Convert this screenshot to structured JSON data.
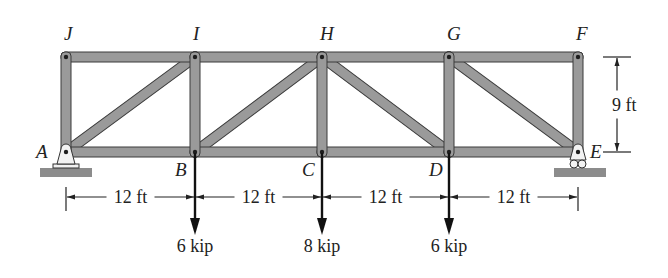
{
  "diagram": {
    "type": "truss",
    "colors": {
      "member": "#9a9a9a",
      "ground": "#8c8c8c",
      "text": "#222222"
    },
    "joints": {
      "J": {
        "label": "J",
        "x": 66,
        "y": 57
      },
      "I": {
        "label": "I",
        "x": 195,
        "y": 57
      },
      "H": {
        "label": "H",
        "x": 322,
        "y": 57
      },
      "G": {
        "label": "G",
        "x": 449,
        "y": 57
      },
      "F": {
        "label": "F",
        "x": 578,
        "y": 57
      },
      "A": {
        "label": "A",
        "x": 66,
        "y": 152
      },
      "B": {
        "label": "B",
        "x": 195,
        "y": 152
      },
      "C": {
        "label": "C",
        "x": 322,
        "y": 152
      },
      "D": {
        "label": "D",
        "x": 449,
        "y": 152
      },
      "E": {
        "label": "E",
        "x": 578,
        "y": 152
      }
    },
    "members": [
      [
        "J",
        "I"
      ],
      [
        "I",
        "H"
      ],
      [
        "H",
        "G"
      ],
      [
        "G",
        "F"
      ],
      [
        "A",
        "B"
      ],
      [
        "B",
        "C"
      ],
      [
        "C",
        "D"
      ],
      [
        "D",
        "E"
      ],
      [
        "A",
        "J"
      ],
      [
        "B",
        "I"
      ],
      [
        "C",
        "H"
      ],
      [
        "D",
        "G"
      ],
      [
        "E",
        "F"
      ],
      [
        "A",
        "I"
      ],
      [
        "B",
        "H"
      ],
      [
        "H",
        "D"
      ],
      [
        "G",
        "E"
      ]
    ],
    "supports": [
      {
        "joint": "A",
        "type": "pin"
      },
      {
        "joint": "E",
        "type": "roller"
      }
    ],
    "dimensions": {
      "horizontal": [
        {
          "label": "12 ft",
          "from": "A",
          "to": "B"
        },
        {
          "label": "12 ft",
          "from": "B",
          "to": "C"
        },
        {
          "label": "12 ft",
          "from": "C",
          "to": "D"
        },
        {
          "label": "12 ft",
          "from": "D",
          "to": "E"
        }
      ],
      "vertical": {
        "label": "9 ft",
        "from": "F",
        "to": "E"
      }
    },
    "loads": [
      {
        "joint": "B",
        "label": "6 kip",
        "value": 6,
        "unit": "kip",
        "direction": "down"
      },
      {
        "joint": "C",
        "label": "8 kip",
        "value": 8,
        "unit": "kip",
        "direction": "down"
      },
      {
        "joint": "D",
        "label": "6 kip",
        "value": 6,
        "unit": "kip",
        "direction": "down"
      }
    ]
  }
}
